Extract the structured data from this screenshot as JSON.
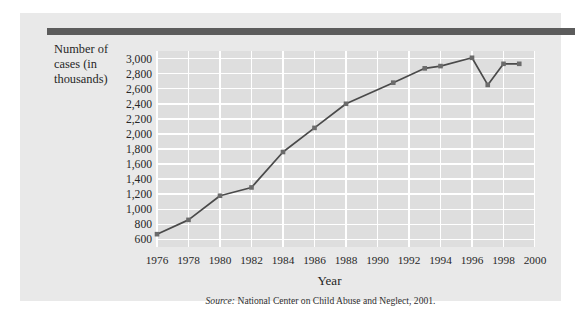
{
  "figure": {
    "y_axis_title": "Number of\ncases (in\nthousands)",
    "x_axis_title": "Year",
    "source_label": "Source:",
    "source_text": "National Center on Child Abuse and Neglect, 2001."
  },
  "colors": {
    "panel_background": "#e9e9e9",
    "plot_background": "#dedede",
    "gridline": "#ffffff",
    "series_line": "#4a4a4a",
    "marker": "#6b6b6b",
    "top_rule": "#5c5c5c",
    "text": "#272727"
  },
  "chart_data": {
    "type": "line",
    "title": "",
    "xlabel": "Year",
    "ylabel": "Number of cases (in thousands)",
    "xlim": [
      1976,
      2000
    ],
    "ylim": [
      500,
      3100
    ],
    "xticks": [
      1976,
      1978,
      1980,
      1982,
      1984,
      1986,
      1988,
      1990,
      1992,
      1994,
      1996,
      1998,
      2000
    ],
    "xtick_labels": [
      "1976",
      "1978",
      "1980",
      "1982",
      "1984",
      "1986",
      "1988",
      "1990",
      "1992",
      "1994",
      "1996",
      "1998",
      "2000"
    ],
    "yticks": [
      600,
      800,
      1000,
      1200,
      1400,
      1600,
      1800,
      2000,
      2200,
      2400,
      2600,
      2800,
      3000
    ],
    "ytick_labels": [
      "600",
      "800",
      "1,000",
      "1,200",
      "1,400",
      "1,600",
      "1,800",
      "2,000",
      "2,200",
      "2,400",
      "2,600",
      "2,800",
      "3,000"
    ],
    "grid": true,
    "legend": "none",
    "series": [
      {
        "name": "Reported cases of child abuse and neglect",
        "x": [
          1976,
          1978,
          1980,
          1982,
          1984,
          1986,
          1988,
          1991,
          1993,
          1994,
          1996,
          1997,
          1998,
          1999
        ],
        "values": [
          670,
          860,
          1180,
          1290,
          1760,
          2080,
          2400,
          2680,
          2870,
          2900,
          3010,
          2650,
          2930,
          2930
        ]
      }
    ]
  }
}
